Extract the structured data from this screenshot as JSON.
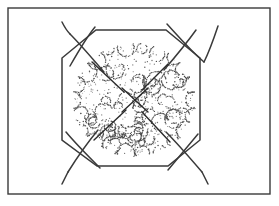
{
  "figure": {
    "caption": "",
    "canvas": {
      "width": 279,
      "height": 206,
      "background": "#ffffff"
    },
    "palette": {
      "ink": "#3a3a3a",
      "ink_dark": "#2b2b2b",
      "stipple": "#4a4a4a",
      "paper": "#ffffff"
    },
    "outer_frame": {
      "name": "outer-border-rectangle",
      "x": 8,
      "y": 8,
      "width": 262,
      "height": 186,
      "stroke": "#3a3a3a",
      "stroke_width": 1.4,
      "fill": "none"
    },
    "octagon": {
      "name": "octagon-outline",
      "stroke": "#3a3a3a",
      "stroke_width": 1.5,
      "fill": "none",
      "points": "96,30 166,30 200,58 200,140 168,166 97,166 62,140 62,58"
    },
    "corner_curves": [
      {
        "name": "corner-curve-top-left-a",
        "d": "M 70,34 C 80,44 92,58 104,72",
        "stroke_width": 1.5
      },
      {
        "name": "corner-curve-top-left-b",
        "d": "M 95,27 C 86,38 78,52 70,66",
        "stroke_width": 1.5
      },
      {
        "name": "corner-curve-top-right-a",
        "d": "M 196,30 C 186,44 176,56 164,70",
        "stroke_width": 1.5
      },
      {
        "name": "corner-curve-top-right-b",
        "d": "M 167,24 C 178,36 190,50 204,62",
        "stroke_width": 1.5
      },
      {
        "name": "corner-curve-bottom-left-a",
        "d": "M 66,132 C 76,144 88,156 100,168",
        "stroke_width": 1.5
      },
      {
        "name": "corner-curve-bottom-left-b",
        "d": "M 98,130 C 88,142 78,156 68,172",
        "stroke_width": 1.5
      },
      {
        "name": "corner-curve-bottom-right-a",
        "d": "M 198,134 C 188,146 178,158 168,170",
        "stroke_width": 1.5
      },
      {
        "name": "corner-curve-bottom-right-b",
        "d": "M 166,132 C 178,144 190,158 202,172",
        "stroke_width": 1.5
      }
    ],
    "curve_tails": [
      {
        "name": "curve-tail-top-left",
        "d": "M 70,34 C 66,30 64,26 62,22"
      },
      {
        "name": "curve-tail-top-right",
        "d": "M 204,62 C 210,50 214,38 218,26"
      },
      {
        "name": "curve-tail-bottom-left",
        "d": "M 68,172 C 66,176 64,180 62,184"
      },
      {
        "name": "curve-tail-bottom-right",
        "d": "M 202,172 C 204,176 206,180 208,184"
      }
    ],
    "center_rays": [
      {
        "name": "ray-upper-left",
        "x1": 92,
        "y1": 62,
        "x2": 124,
        "y2": 92
      },
      {
        "name": "ray-upper-right",
        "x1": 168,
        "y1": 64,
        "x2": 142,
        "y2": 90
      },
      {
        "name": "ray-lower-left",
        "x1": 94,
        "y1": 140,
        "x2": 126,
        "y2": 110
      },
      {
        "name": "ray-lower-right",
        "x1": 170,
        "y1": 142,
        "x2": 142,
        "y2": 112
      }
    ],
    "center_cross": {
      "name": "center-x-mark",
      "stroke_width": 1.4,
      "segments": [
        {
          "x1": 122,
          "y1": 88,
          "x2": 148,
          "y2": 112
        },
        {
          "x1": 148,
          "y1": 88,
          "x2": 122,
          "y2": 112
        }
      ]
    },
    "foliage_mass": {
      "name": "stippled-foliage-cluster",
      "center_x": 134,
      "center_y": 100,
      "radius_x": 60,
      "radius_y": 55,
      "dot_color": "#4a4a4a",
      "dot_radius": 0.55,
      "scallop_count": 46,
      "description": "Irregular cloud-like mass rendered as dotted scalloped arcs"
    }
  }
}
